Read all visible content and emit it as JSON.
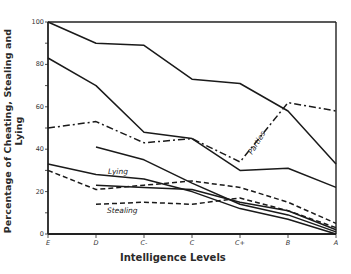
{
  "chart_data": {
    "type": "line",
    "title": "",
    "xlabel": "Intelligence Levels",
    "ylabel": "Percentage of Cheating, Stealing and Lying",
    "categories": [
      "E",
      "D",
      "C-",
      "C",
      "C+",
      "B",
      "A"
    ],
    "ylim": [
      0,
      100
    ],
    "yticks": [
      0,
      20,
      40,
      60,
      80,
      100
    ],
    "grid": false,
    "legend": "inline labels",
    "series": [
      {
        "name": "Cheating (upper)",
        "style": "solid",
        "values": [
          100,
          90,
          89,
          73,
          71,
          58,
          33
        ]
      },
      {
        "name": "Cheating (lower)",
        "style": "solid",
        "values": [
          83,
          70,
          48,
          45,
          30,
          31,
          22
        ]
      },
      {
        "name": "Parties",
        "style": "dashdot",
        "label": "Parties",
        "values": [
          50,
          53,
          43,
          45,
          34,
          62,
          58
        ]
      },
      {
        "name": "Lying (upper)",
        "style": "solid",
        "values": [
          null,
          41,
          35,
          24,
          14,
          9,
          1
        ]
      },
      {
        "name": "Lying",
        "style": "solid",
        "label": "Lying",
        "values": [
          33,
          28,
          26,
          20,
          12,
          7,
          0
        ]
      },
      {
        "name": "Lying (lower)",
        "style": "solid",
        "values": [
          null,
          23,
          22,
          21,
          15,
          11,
          2
        ]
      },
      {
        "name": "Stealing (upper)",
        "style": "dashed",
        "values": [
          30,
          21,
          23,
          25,
          22,
          15,
          5
        ]
      },
      {
        "name": "Stealing",
        "style": "dashed",
        "label": "Stealing",
        "values": [
          null,
          14,
          15,
          14,
          17,
          11,
          3
        ]
      }
    ]
  },
  "labels": {
    "xlabel": "Intelligence Levels",
    "ylabel": "Percentage of Cheating, Stealing and Lying",
    "parties": "Parties",
    "lying": "Lying",
    "stealing": "Stealing"
  }
}
